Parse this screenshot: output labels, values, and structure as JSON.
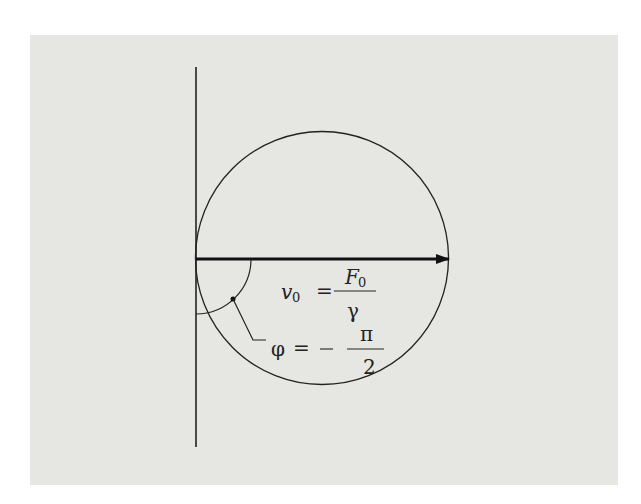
{
  "figure": {
    "label_velocity": {
      "lhs": "v",
      "lhs_sub": "0",
      "equals": "=",
      "numerator": "F",
      "numerator_sub": "0",
      "denominator": "γ"
    },
    "label_phase": {
      "lhs": "φ",
      "equals": "=",
      "sign": "—",
      "numerator": "π",
      "denominator": "2"
    }
  }
}
